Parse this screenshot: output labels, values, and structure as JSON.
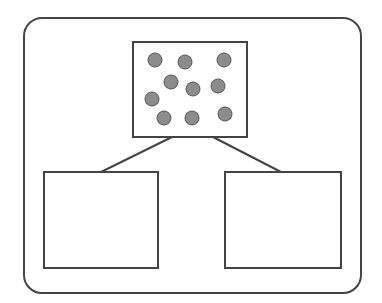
{
  "diagram": {
    "type": "tree",
    "stroke_color": "#444444",
    "dot_color": "#8c8c8c",
    "dot_stroke": "#555555",
    "frame": {
      "x": 24,
      "y": 18,
      "w": 337,
      "h": 275,
      "r": 18
    },
    "parent": {
      "x": 133,
      "y": 42,
      "w": 114,
      "h": 95,
      "dot_count": 10
    },
    "children": [
      {
        "x": 44,
        "y": 172,
        "w": 114,
        "h": 96
      },
      {
        "x": 225,
        "y": 172,
        "w": 116,
        "h": 96
      }
    ],
    "dots": [
      {
        "cx": 155,
        "cy": 60
      },
      {
        "cx": 185,
        "cy": 62
      },
      {
        "cx": 224,
        "cy": 60
      },
      {
        "cx": 171,
        "cy": 82
      },
      {
        "cx": 193,
        "cy": 89
      },
      {
        "cx": 218,
        "cy": 86
      },
      {
        "cx": 152,
        "cy": 99
      },
      {
        "cx": 164,
        "cy": 118
      },
      {
        "cx": 192,
        "cy": 118
      },
      {
        "cx": 225,
        "cy": 114
      }
    ]
  }
}
